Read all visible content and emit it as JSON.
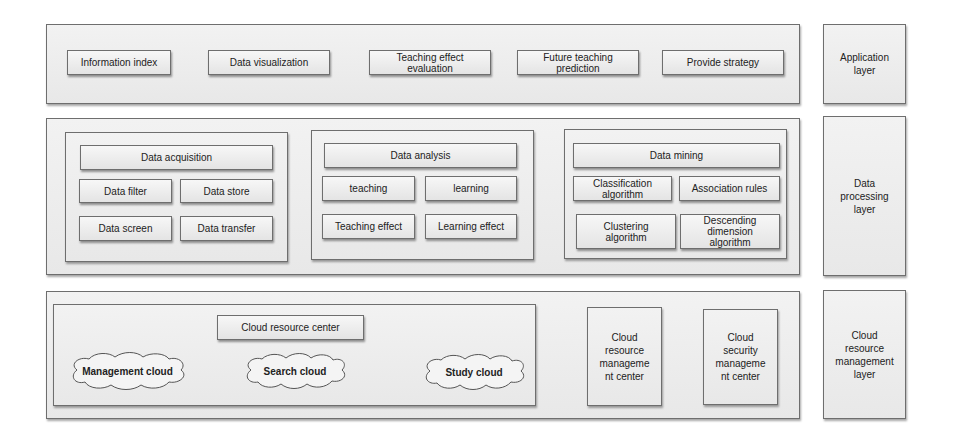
{
  "application_layer": {
    "label": "Application layer",
    "items": [
      "Information index",
      "Data visualization",
      "Teaching effect evaluation",
      "Future teaching prediction",
      "Provide strategy"
    ]
  },
  "data_processing_layer": {
    "label": "Data processing layer",
    "acquisition": {
      "title": "Data acquisition",
      "items": [
        "Data filter",
        "Data store",
        "Data screen",
        "Data transfer"
      ]
    },
    "analysis": {
      "title": "Data analysis",
      "items": [
        "teaching",
        "learning",
        "Teaching effect",
        "Learning effect"
      ]
    },
    "mining": {
      "title": "Data mining",
      "items": [
        "Classification algorithm",
        "Association rules",
        "Clustering algorithm",
        "Descending dimension algorithm"
      ]
    }
  },
  "cloud_layer": {
    "label": "Cloud resource management layer",
    "resource_center": "Cloud resource center",
    "clouds": [
      "Management cloud",
      "Search cloud",
      "Study cloud"
    ],
    "centers": [
      "Cloud resource manageme nt center",
      "Cloud security manageme nt center"
    ]
  }
}
